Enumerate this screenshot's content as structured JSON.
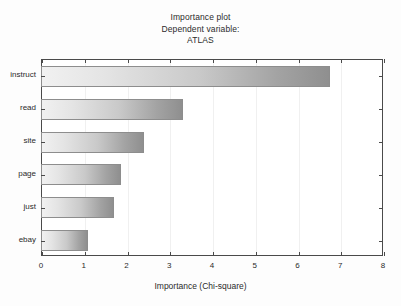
{
  "chart_data": {
    "type": "bar",
    "orientation": "horizontal",
    "title": "Importance plot",
    "subtitle": "Dependent variable:",
    "subtitle2": "ATLAS",
    "xlabel": "Importance (Chi-square)",
    "ylabel": "",
    "xlim": [
      0,
      8
    ],
    "xticks": [
      0,
      1,
      2,
      3,
      4,
      5,
      6,
      7,
      8
    ],
    "xtick_labels": [
      "0",
      "1",
      "2",
      "3",
      "4",
      "5",
      "6",
      "7",
      "8"
    ],
    "categories": [
      "instruct",
      "read",
      "site",
      "page",
      "just",
      "ebay"
    ],
    "values": [
      6.74,
      3.3,
      2.39,
      1.85,
      1.68,
      1.08
    ],
    "grid": "vertical",
    "legend": "none",
    "bar_gradient_start": "#f1f1f1",
    "bar_gradient_end": "#8f8f8f",
    "bar_border_color": "#8d8d8d",
    "axis_color": "#4a4a4a",
    "background_color": "#ffffff",
    "figure_background_color": "#fdfdfd"
  }
}
